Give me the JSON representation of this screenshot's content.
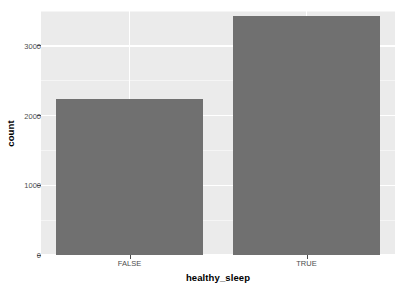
{
  "chart_data": {
    "type": "bar",
    "title": "",
    "subtitle": "",
    "xlabel": "healthy_sleep",
    "ylabel": "count",
    "categories": [
      "FALSE",
      "TRUE"
    ],
    "values": [
      2242,
      3424
    ],
    "ylim": [
      0,
      3500
    ],
    "y_ticks": [
      0,
      1000,
      2000,
      3000
    ],
    "y_tick_labels": [
      "0",
      "1000",
      "2000",
      "3000"
    ],
    "y_minor_ticks": [
      500,
      1500,
      2500,
      3500
    ],
    "grid": true,
    "legend": "none",
    "bar_color": "#707070",
    "panel_background": "#ebebeb",
    "gridline_color": "#ffffff",
    "axis_text_color": "#4d4d4d",
    "series": [
      {
        "name": "count",
        "values": [
          2242,
          3424
        ]
      }
    ]
  },
  "axes": {
    "y_title": "count",
    "x_title": "healthy_sleep"
  }
}
